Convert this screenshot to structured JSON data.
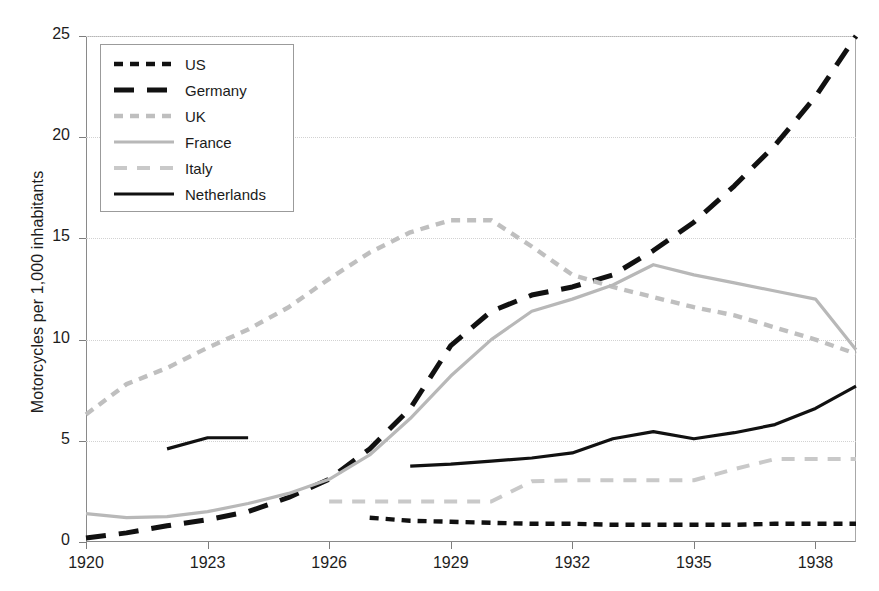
{
  "chart_data": {
    "type": "line",
    "title": "",
    "xlabel": "",
    "ylabel": "Motorcycles per 1,000 inhabitants",
    "xlim": [
      1920,
      1939
    ],
    "ylim": [
      0,
      25
    ],
    "yticks": [
      0,
      5,
      10,
      15,
      20,
      25
    ],
    "xticks": [
      1920,
      1923,
      1926,
      1929,
      1932,
      1935,
      1938
    ],
    "grid": true,
    "legend_position": "top-left",
    "series": [
      {
        "name": "US",
        "color": "#111111",
        "style": "dashed-short",
        "x": [
          1927,
          1928,
          1929,
          1930,
          1931,
          1932,
          1933,
          1934,
          1935,
          1936,
          1937,
          1938,
          1939
        ],
        "values": [
          1.2,
          1.05,
          1.0,
          0.95,
          0.9,
          0.9,
          0.85,
          0.85,
          0.85,
          0.85,
          0.9,
          0.9,
          0.9
        ]
      },
      {
        "name": "Germany",
        "color": "#111111",
        "style": "dashed-long",
        "x": [
          1920,
          1921,
          1922,
          1923,
          1924,
          1925,
          1926,
          1927,
          1928,
          1929,
          1930,
          1931,
          1932,
          1933,
          1934,
          1935,
          1936,
          1937,
          1938,
          1939
        ],
        "values": [
          0.2,
          0.45,
          0.8,
          1.1,
          1.5,
          2.2,
          3.1,
          4.6,
          6.6,
          9.7,
          11.4,
          12.2,
          12.6,
          13.2,
          14.4,
          15.8,
          17.6,
          19.6,
          22.0,
          25.0
        ]
      },
      {
        "name": "UK",
        "color": "#bfbfbf",
        "style": "dashed-short",
        "x": [
          1920,
          1921,
          1922,
          1923,
          1924,
          1925,
          1926,
          1927,
          1928,
          1929,
          1930,
          1931,
          1932,
          1933,
          1934,
          1935,
          1936,
          1937,
          1938,
          1939
        ],
        "values": [
          6.3,
          7.8,
          8.6,
          9.6,
          10.5,
          11.6,
          13.0,
          14.3,
          15.3,
          15.9,
          15.9,
          14.6,
          13.2,
          12.6,
          12.1,
          11.6,
          11.2,
          10.6,
          10.0,
          9.3
        ]
      },
      {
        "name": "France",
        "color": "#b8b8b8",
        "style": "solid",
        "x": [
          1920,
          1921,
          1922,
          1923,
          1924,
          1925,
          1926,
          1927,
          1928,
          1929,
          1930,
          1931,
          1932,
          1933,
          1934,
          1935,
          1936,
          1937,
          1938,
          1939
        ],
        "values": [
          1.4,
          1.2,
          1.25,
          1.5,
          1.9,
          2.4,
          3.1,
          4.3,
          6.1,
          8.2,
          10.0,
          11.4,
          12.0,
          12.7,
          13.7,
          13.2,
          12.8,
          12.4,
          12.0,
          9.5
        ]
      },
      {
        "name": "Italy",
        "color": "#c9c9c9",
        "style": "dashed-medium",
        "x": [
          1926,
          1927,
          1928,
          1929,
          1930,
          1931,
          1932,
          1933,
          1934,
          1935,
          1936,
          1937,
          1938,
          1939
        ],
        "values": [
          2.0,
          2.0,
          2.0,
          2.0,
          2.0,
          3.0,
          3.05,
          3.05,
          3.05,
          3.05,
          3.6,
          4.1,
          4.1,
          4.1
        ]
      },
      {
        "name": "Netherlands",
        "color": "#111111",
        "style": "solid",
        "segments": [
          {
            "x": [
              1922,
              1923,
              1924
            ],
            "values": [
              4.6,
              5.15,
              5.15
            ]
          },
          {
            "x": [
              1928,
              1929,
              1930,
              1931,
              1932,
              1933,
              1934,
              1935,
              1936,
              1937,
              1938,
              1939
            ],
            "values": [
              3.75,
              3.85,
              4.0,
              4.15,
              4.4,
              5.1,
              5.45,
              5.1,
              5.4,
              5.8,
              6.6,
              7.7
            ]
          }
        ]
      }
    ]
  },
  "legend": {
    "items": [
      {
        "label": "US"
      },
      {
        "label": "Germany"
      },
      {
        "label": "UK"
      },
      {
        "label": "France"
      },
      {
        "label": "Italy"
      },
      {
        "label": "Netherlands"
      }
    ]
  },
  "axis": {
    "y_title": "Motorcycles per 1,000 inhabitants",
    "y_labels": [
      "0",
      "5",
      "10",
      "15",
      "20",
      "25"
    ],
    "x_labels": [
      "1920",
      "1923",
      "1926",
      "1929",
      "1932",
      "1935",
      "1938"
    ]
  }
}
